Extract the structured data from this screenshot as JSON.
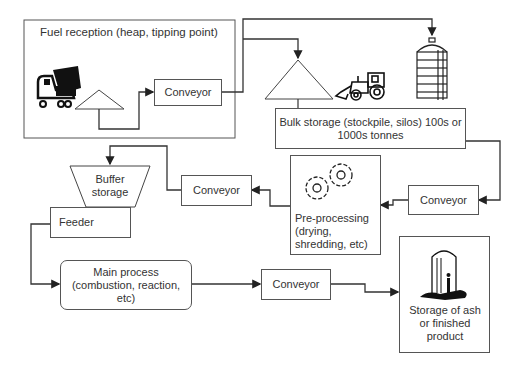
{
  "nodes": {
    "fuel_reception": {
      "label": "Fuel reception (heap, tipping point)"
    },
    "conveyor_1": {
      "label": "Conveyor"
    },
    "bulk_storage": {
      "label": "Bulk storage (stockpile, silos) 100s or 1000s tonnes"
    },
    "conveyor_2": {
      "label": "Conveyor"
    },
    "pre_processing": {
      "label": "Pre-processing (drying, shredding, etc)"
    },
    "conveyor_3": {
      "label": "Conveyor"
    },
    "buffer_storage": {
      "label": "Buffer storage"
    },
    "feeder": {
      "label": "Feeder"
    },
    "main_process": {
      "label": "Main process (combustion, reaction, etc)"
    },
    "conveyor_4": {
      "label": "Conveyor"
    },
    "ash_storage": {
      "label": "Storage of ash or finished product"
    }
  },
  "icons": [
    "dump-truck-icon",
    "heap-icon",
    "stockpile-icon",
    "loader-icon",
    "silo-icon",
    "gears-icon",
    "ash-silo-icon"
  ],
  "colors": {
    "line": "#333333",
    "fill": "#111111",
    "border": "#555555"
  }
}
